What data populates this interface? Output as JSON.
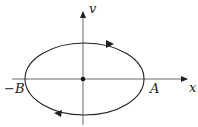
{
  "diagram": {
    "axes": {
      "x_label": "x",
      "y_label": "v"
    },
    "points": {
      "right": "A",
      "left": "−B"
    },
    "curve": "ellipse",
    "direction": "clockwise",
    "origin_marker": "dot",
    "colors": {
      "stroke": "#222222",
      "background": "#ffffff"
    }
  }
}
